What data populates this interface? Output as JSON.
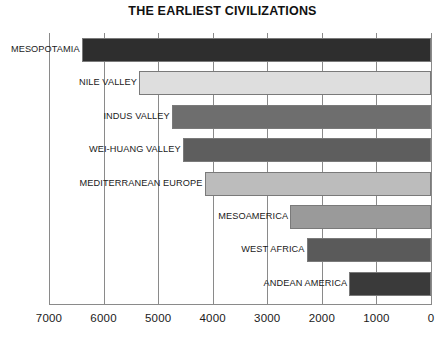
{
  "chart_data": {
    "type": "bar",
    "orientation": "horizontal",
    "title": "THE EARLIEST CIVILIZATIONS",
    "xlabel": "",
    "ylabel": "",
    "xlim": [
      7000,
      0
    ],
    "x_axis_direction": "reversed",
    "grid": true,
    "legend": "none",
    "xticks": [
      "7000",
      "6000",
      "5000",
      "4000",
      "3000",
      "2000",
      "1000",
      "0"
    ],
    "xtick_values": [
      7000,
      6000,
      5000,
      4000,
      3000,
      2000,
      1000,
      0
    ],
    "categories": [
      "MESOPOTAMIA",
      "NILE VALLEY",
      "INDUS VALLEY",
      "WEI-HUANG VALLEY",
      "MEDITERRANEAN EUROPE",
      "MESOAMERICA",
      "WEST AFRICA",
      "ANDEAN AMERICA"
    ],
    "bars": [
      {
        "label": "MESOPOTAMIA",
        "start": 6400,
        "end": 0,
        "color": "#2e2e2e"
      },
      {
        "label": "NILE VALLEY",
        "start": 5350,
        "end": 0,
        "color": "#dedede"
      },
      {
        "label": "INDUS VALLEY",
        "start": 4750,
        "end": 0,
        "color": "#6e6e6e"
      },
      {
        "label": "WEI-HUANG VALLEY",
        "start": 4550,
        "end": 0,
        "color": "#5e5e5e"
      },
      {
        "label": "MEDITERRANEAN EUROPE",
        "start": 4150,
        "end": 0,
        "color": "#bcbcbc"
      },
      {
        "label": "MESOAMERICA",
        "start": 2580,
        "end": 0,
        "color": "#9a9a9a"
      },
      {
        "label": "WEST AFRICA",
        "start": 2280,
        "end": 0,
        "color": "#5a5a5a"
      },
      {
        "label": "ANDEAN AMERICA",
        "start": 1500,
        "end": 0,
        "color": "#3a3a3a"
      }
    ],
    "values": [
      6400,
      5350,
      4750,
      4550,
      4150,
      2580,
      2280,
      1500
    ],
    "units": "years BCE (start date of civilization)"
  }
}
